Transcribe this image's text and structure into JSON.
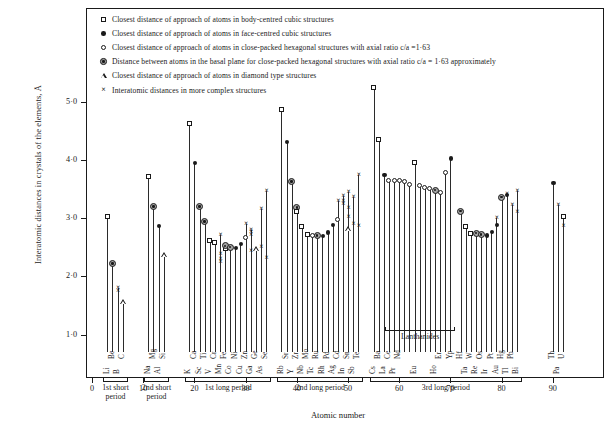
{
  "chart_data": {
    "type": "scatter",
    "title": "",
    "xlabel": "Atomic number",
    "ylabel": "Interatomic distances  in crystals  of the elements,  Å",
    "xlim": [
      0,
      100
    ],
    "ylim": [
      0,
      5.5
    ],
    "xticks": [
      0,
      10,
      20,
      30,
      40,
      50,
      60,
      70,
      80,
      90
    ],
    "yticks": [
      "1·0",
      "2·0",
      "3·0",
      "4·0",
      "5·0"
    ],
    "ytick_values": [
      1.0,
      2.0,
      3.0,
      4.0,
      5.0
    ],
    "grid": false,
    "legend_position": "top-inside",
    "series": [
      {
        "key": "bcc",
        "name": "Closest distance of approach of atoms in body-centred cubic structures",
        "marker": "open-square"
      },
      {
        "key": "fcc",
        "name": "Closest distance of approach of atoms in face-centred cubic structures",
        "marker": "filled-circle"
      },
      {
        "key": "hcp",
        "name": "Closest distance of approach of atoms  in close-packed hexagonal structures with axial ratio c/a =1·63",
        "marker": "open-circle"
      },
      {
        "key": "basal",
        "name": "Distance between atoms in  the basal plane for close-packed hexagonal structures with axial ratio c/a = 1·63 approximately",
        "marker": "bullseye-circle"
      },
      {
        "key": "diamond",
        "name": "Closest distance of approach of atoms in diamond type structures",
        "marker": "open-triangle"
      },
      {
        "key": "complex",
        "name": "Interatomic distances in more complex structures",
        "marker": "cross"
      }
    ],
    "points": [
      {
        "z": 3,
        "el": "Li",
        "vals": [
          {
            "s": "bcc",
            "y": 3.03
          }
        ]
      },
      {
        "z": 4,
        "el": "Be",
        "vals": [
          {
            "s": "basal",
            "y": 2.22
          }
        ]
      },
      {
        "z": 5,
        "el": "B",
        "vals": [
          {
            "s": "complex",
            "y": 1.8
          },
          {
            "s": "complex",
            "y": 1.74
          }
        ]
      },
      {
        "z": 6,
        "el": "C",
        "vals": [
          {
            "s": "diamond",
            "y": 1.54
          }
        ]
      },
      {
        "z": 11,
        "el": "Na",
        "vals": [
          {
            "s": "bcc",
            "y": 3.72
          }
        ]
      },
      {
        "z": 12,
        "el": "Mg",
        "vals": [
          {
            "s": "basal",
            "y": 3.2
          }
        ]
      },
      {
        "z": 13,
        "el": "Al",
        "vals": [
          {
            "s": "fcc",
            "y": 2.86
          }
        ]
      },
      {
        "z": 14,
        "el": "Si",
        "vals": [
          {
            "s": "diamond",
            "y": 2.35
          }
        ]
      },
      {
        "z": 19,
        "el": "K",
        "vals": [
          {
            "s": "bcc",
            "y": 4.62
          }
        ]
      },
      {
        "z": 20,
        "el": "Ca",
        "vals": [
          {
            "s": "fcc",
            "y": 3.94
          }
        ]
      },
      {
        "z": 21,
        "el": "Sc",
        "vals": [
          {
            "s": "basal",
            "y": 3.2
          }
        ]
      },
      {
        "z": 22,
        "el": "Ti",
        "vals": [
          {
            "s": "basal",
            "y": 2.94
          }
        ]
      },
      {
        "z": 23,
        "el": "V",
        "vals": [
          {
            "s": "bcc",
            "y": 2.62
          }
        ]
      },
      {
        "z": 24,
        "el": "Cr",
        "vals": [
          {
            "s": "bcc",
            "y": 2.58
          }
        ]
      },
      {
        "z": 25,
        "el": "Mn",
        "vals": [
          {
            "s": "complex",
            "y": 2.7
          },
          {
            "s": "complex",
            "y": 2.38
          },
          {
            "s": "complex",
            "y": 2.3
          },
          {
            "s": "complex",
            "y": 2.24
          }
        ]
      },
      {
        "z": 26,
        "el": "Fe",
        "vals": [
          {
            "s": "bcc",
            "y": 2.48
          },
          {
            "s": "basal",
            "y": 2.52
          }
        ]
      },
      {
        "z": 27,
        "el": "Co",
        "vals": [
          {
            "s": "basal",
            "y": 2.5
          }
        ]
      },
      {
        "z": 28,
        "el": "Ni",
        "vals": [
          {
            "s": "fcc",
            "y": 2.49
          }
        ]
      },
      {
        "z": 29,
        "el": "Cu",
        "vals": [
          {
            "s": "fcc",
            "y": 2.55
          }
        ]
      },
      {
        "z": 30,
        "el": "Zn",
        "vals": [
          {
            "s": "hcp",
            "y": 2.66
          },
          {
            "s": "complex",
            "y": 2.9
          }
        ]
      },
      {
        "z": 31,
        "el": "Ga",
        "vals": [
          {
            "s": "complex",
            "y": 2.44
          },
          {
            "s": "complex",
            "y": 2.7
          },
          {
            "s": "complex",
            "y": 2.76
          },
          {
            "s": "complex",
            "y": 2.8
          }
        ]
      },
      {
        "z": 32,
        "el": "Ge",
        "vals": [
          {
            "s": "diamond",
            "y": 2.45
          }
        ]
      },
      {
        "z": 33,
        "el": "As",
        "vals": [
          {
            "s": "complex",
            "y": 2.51
          },
          {
            "s": "complex",
            "y": 3.15
          }
        ]
      },
      {
        "z": 34,
        "el": "Se",
        "vals": [
          {
            "s": "complex",
            "y": 2.32
          },
          {
            "s": "complex",
            "y": 3.46
          }
        ]
      },
      {
        "z": 37,
        "el": "Rb",
        "vals": [
          {
            "s": "bcc",
            "y": 4.87
          }
        ]
      },
      {
        "z": 38,
        "el": "Sr",
        "vals": [
          {
            "s": "fcc",
            "y": 4.3
          }
        ]
      },
      {
        "z": 39,
        "el": "Y",
        "vals": [
          {
            "s": "basal",
            "y": 3.63
          }
        ]
      },
      {
        "z": 40,
        "el": "Zr",
        "vals": [
          {
            "s": "basal",
            "y": 3.18
          },
          {
            "s": "bcc",
            "y": 3.12
          }
        ]
      },
      {
        "z": 41,
        "el": "Nb",
        "vals": [
          {
            "s": "bcc",
            "y": 2.86
          }
        ]
      },
      {
        "z": 42,
        "el": "Mo",
        "vals": [
          {
            "s": "bcc",
            "y": 2.72
          }
        ]
      },
      {
        "z": 43,
        "el": "Tc",
        "vals": [
          {
            "s": "hcp",
            "y": 2.7
          }
        ]
      },
      {
        "z": 44,
        "el": "Ru",
        "vals": [
          {
            "s": "basal",
            "y": 2.7
          }
        ]
      },
      {
        "z": 45,
        "el": "Rh",
        "vals": [
          {
            "s": "fcc",
            "y": 2.69
          }
        ]
      },
      {
        "z": 46,
        "el": "Pd",
        "vals": [
          {
            "s": "fcc",
            "y": 2.75
          }
        ]
      },
      {
        "z": 47,
        "el": "Ag",
        "vals": [
          {
            "s": "fcc",
            "y": 2.88
          }
        ]
      },
      {
        "z": 48,
        "el": "Cd",
        "vals": [
          {
            "s": "hcp",
            "y": 2.97
          },
          {
            "s": "complex",
            "y": 3.3
          }
        ]
      },
      {
        "z": 49,
        "el": "In",
        "vals": [
          {
            "s": "complex",
            "y": 3.24
          },
          {
            "s": "complex",
            "y": 3.38
          },
          {
            "s": "complex",
            "y": 3.3
          }
        ]
      },
      {
        "z": 50,
        "el": "Sn",
        "vals": [
          {
            "s": "diamond",
            "y": 2.8
          },
          {
            "s": "complex",
            "y": 3.02
          },
          {
            "s": "complex",
            "y": 3.18
          },
          {
            "s": "complex",
            "y": 3.44
          }
        ]
      },
      {
        "z": 51,
        "el": "Sb",
        "vals": [
          {
            "s": "complex",
            "y": 2.9
          },
          {
            "s": "complex",
            "y": 3.36
          }
        ]
      },
      {
        "z": 52,
        "el": "Te",
        "vals": [
          {
            "s": "complex",
            "y": 2.86
          },
          {
            "s": "complex",
            "y": 3.74
          }
        ]
      },
      {
        "z": 55,
        "el": "Cs",
        "vals": [
          {
            "s": "bcc",
            "y": 5.24
          }
        ]
      },
      {
        "z": 56,
        "el": "Ba",
        "vals": [
          {
            "s": "bcc",
            "y": 4.34
          }
        ]
      },
      {
        "z": 57,
        "el": "La",
        "vals": [
          {
            "s": "fcc",
            "y": 3.74
          }
        ]
      },
      {
        "z": 58,
        "el": "Ce",
        "vals": [
          {
            "s": "hcp",
            "y": 3.64
          }
        ]
      },
      {
        "z": 59,
        "el": "Pr",
        "vals": [
          {
            "s": "hcp",
            "y": 3.64
          }
        ]
      },
      {
        "z": 60,
        "el": "Nd",
        "vals": [
          {
            "s": "hcp",
            "y": 3.64
          }
        ]
      },
      {
        "z": 61,
        "el": "",
        "vals": [
          {
            "s": "hcp",
            "y": 3.62
          }
        ]
      },
      {
        "z": 62,
        "el": "",
        "vals": [
          {
            "s": "hcp",
            "y": 3.58
          }
        ]
      },
      {
        "z": 63,
        "el": "Eu",
        "vals": [
          {
            "s": "bcc",
            "y": 3.96
          }
        ]
      },
      {
        "z": 64,
        "el": "",
        "vals": [
          {
            "s": "hcp",
            "y": 3.56
          }
        ]
      },
      {
        "z": 65,
        "el": "",
        "vals": [
          {
            "s": "hcp",
            "y": 3.52
          }
        ]
      },
      {
        "z": 66,
        "el": "",
        "vals": [
          {
            "s": "hcp",
            "y": 3.5
          }
        ]
      },
      {
        "z": 67,
        "el": "Ho",
        "vals": [
          {
            "s": "basal",
            "y": 3.48
          }
        ]
      },
      {
        "z": 68,
        "el": "Er",
        "vals": [
          {
            "s": "hcp",
            "y": 3.44
          }
        ]
      },
      {
        "z": 69,
        "el": "",
        "vals": [
          {
            "s": "hcp",
            "y": 3.78
          }
        ]
      },
      {
        "z": 70,
        "el": "Yp",
        "vals": [
          {
            "s": "fcc",
            "y": 4.02
          }
        ]
      },
      {
        "z": 72,
        "el": "Hf",
        "vals": [
          {
            "s": "basal",
            "y": 3.12
          }
        ]
      },
      {
        "z": 73,
        "el": "Ta",
        "vals": [
          {
            "s": "bcc",
            "y": 2.86
          }
        ]
      },
      {
        "z": 74,
        "el": "W",
        "vals": [
          {
            "s": "bcc",
            "y": 2.74
          }
        ]
      },
      {
        "z": 75,
        "el": "Re",
        "vals": [
          {
            "s": "basal",
            "y": 2.74
          }
        ]
      },
      {
        "z": 76,
        "el": "Os",
        "vals": [
          {
            "s": "basal",
            "y": 2.72
          }
        ]
      },
      {
        "z": 77,
        "el": "Ir",
        "vals": [
          {
            "s": "fcc",
            "y": 2.7
          }
        ]
      },
      {
        "z": 78,
        "el": "Pt",
        "vals": [
          {
            "s": "fcc",
            "y": 2.76
          }
        ]
      },
      {
        "z": 79,
        "el": "Au",
        "vals": [
          {
            "s": "fcc",
            "y": 2.88
          },
          {
            "s": "complex",
            "y": 3.0
          }
        ]
      },
      {
        "z": 80,
        "el": "Hg",
        "vals": [
          {
            "s": "basal",
            "y": 3.36
          }
        ]
      },
      {
        "z": 81,
        "el": "Tl",
        "vals": [
          {
            "s": "fcc",
            "y": 3.4
          },
          {
            "s": "complex",
            "y": 3.42
          }
        ]
      },
      {
        "z": 82,
        "el": "Pb",
        "vals": [
          {
            "s": "complex",
            "y": 3.22
          }
        ]
      },
      {
        "z": 83,
        "el": "Bi",
        "vals": [
          {
            "s": "complex",
            "y": 3.1
          },
          {
            "s": "complex",
            "y": 3.46
          }
        ]
      },
      {
        "z": 90,
        "el": "Th",
        "vals": [
          {
            "s": "fcc",
            "y": 3.6
          }
        ]
      },
      {
        "z": 91,
        "el": "Pa",
        "vals": [
          {
            "s": "complex",
            "y": 3.22
          }
        ]
      },
      {
        "z": 92,
        "el": "U",
        "vals": [
          {
            "s": "bcc",
            "y": 3.02
          },
          {
            "s": "complex",
            "y": 2.86
          }
        ]
      }
    ],
    "period_brackets": [
      {
        "id": "short1",
        "label": "1st short\nperiod",
        "from": 3,
        "to": 6
      },
      {
        "id": "short2",
        "label": "2nd short\nperiod",
        "from": 11,
        "to": 14
      },
      {
        "id": "long1",
        "label": "1st long period",
        "from": 19,
        "to": 34
      },
      {
        "id": "long2",
        "label": "2nd long period",
        "from": 37,
        "to": 52
      },
      {
        "id": "long3",
        "label": "3rd long period",
        "from": 55,
        "to": 83
      }
    ],
    "sub_brackets": [
      {
        "id": "lanthanides",
        "label": "Lanthanides",
        "from": 58,
        "to": 70
      }
    ]
  }
}
